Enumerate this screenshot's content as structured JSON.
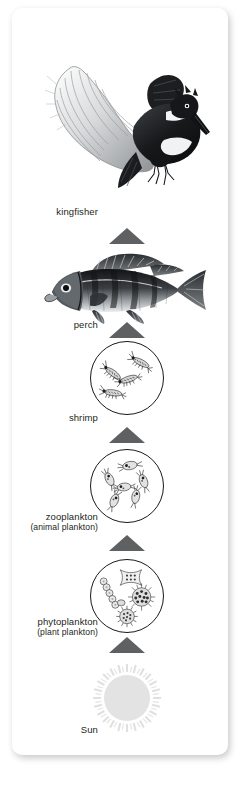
{
  "diagram": {
    "orientation": "vertical-bottom-up",
    "arrow_color": "#5f6062",
    "text_color": "#231f20",
    "card_background": "#ffffff",
    "sun_color": "#e3e3e3",
    "levels": [
      {
        "id": "kingfisher",
        "label": "kingfisher",
        "sublabel": "",
        "art": "kingfisher-illustration",
        "trophic_rank": 5
      },
      {
        "id": "perch",
        "label": "perch",
        "sublabel": "",
        "art": "perch-fish-illustration",
        "trophic_rank": 4
      },
      {
        "id": "shrimp",
        "label": "shrimp",
        "sublabel": "",
        "art": "shrimp-circle-illustration",
        "trophic_rank": 3
      },
      {
        "id": "zooplankton",
        "label": "zooplankton",
        "sublabel": "(animal plankton)",
        "art": "zooplankton-circle-illustration",
        "trophic_rank": 2
      },
      {
        "id": "phytoplankton",
        "label": "phytoplankton",
        "sublabel": "(plant plankton)",
        "art": "phytoplankton-circle-illustration",
        "trophic_rank": 1
      },
      {
        "id": "sun",
        "label": "Sun",
        "sublabel": "",
        "art": "sun-illustration",
        "trophic_rank": 0
      }
    ]
  }
}
